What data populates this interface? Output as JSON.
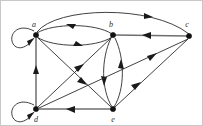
{
  "figure": {
    "type": "directed-graph",
    "width": 203,
    "height": 126,
    "background_color": "#ffffff",
    "border_color": "#c8c8c8",
    "edge_color": "#2b2b2b",
    "axis_color": "#6e6e6e",
    "node_color": "#111111",
    "label_color": "#2a2a2a"
  },
  "graph_data": {
    "type": "directed-graph",
    "node_count": 5,
    "edge_count": 13,
    "nodes": [
      {
        "id": "a",
        "label": "a",
        "x": 35,
        "y": 34,
        "label_x": 33,
        "label_y": 26
      },
      {
        "id": "b",
        "label": "b",
        "x": 112,
        "y": 34,
        "label_x": 110,
        "label_y": 26
      },
      {
        "id": "c",
        "label": "c",
        "x": 188,
        "y": 35,
        "label_x": 186,
        "label_y": 26
      },
      {
        "id": "d",
        "label": "d",
        "x": 35,
        "y": 108,
        "label_x": 34,
        "label_y": 120
      },
      {
        "id": "e",
        "label": "e",
        "x": 112,
        "y": 108,
        "label_x": 110,
        "label_y": 120
      }
    ],
    "edges": [
      {
        "from": "a",
        "to": "a",
        "shape": "self-loop",
        "side": "left"
      },
      {
        "from": "d",
        "to": "d",
        "shape": "self-loop",
        "side": "left"
      },
      {
        "from": "a",
        "to": "b",
        "shape": "curve-lower"
      },
      {
        "from": "b",
        "to": "a",
        "shape": "curve-upper"
      },
      {
        "from": "a",
        "to": "c",
        "shape": "arc-over-top"
      },
      {
        "from": "c",
        "to": "b",
        "shape": "straight-horizontal"
      },
      {
        "from": "b",
        "to": "e",
        "shape": "curve-left"
      },
      {
        "from": "e",
        "to": "b",
        "shape": "curve-right"
      },
      {
        "from": "d",
        "to": "a",
        "shape": "straight-vertical"
      },
      {
        "from": "e",
        "to": "d",
        "shape": "straight-horizontal"
      },
      {
        "from": "a",
        "to": "e",
        "shape": "diagonal"
      },
      {
        "from": "d",
        "to": "b",
        "shape": "diagonal"
      },
      {
        "from": "d",
        "to": "c",
        "shape": "diagonal-long"
      },
      {
        "from": "e",
        "to": "c",
        "shape": "diagonal"
      }
    ]
  }
}
